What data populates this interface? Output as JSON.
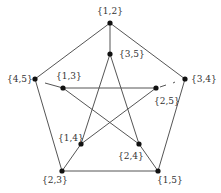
{
  "diagram": {
    "type": "graph",
    "nodes": [
      {
        "id": "12",
        "label": "{1,2}",
        "x": 110,
        "y": 23,
        "lx": 110,
        "ly": 14,
        "anchor": "middle"
      },
      {
        "id": "35",
        "label": "{3,5}",
        "x": 110,
        "y": 54,
        "lx": 119,
        "ly": 57,
        "anchor": "start"
      },
      {
        "id": "45",
        "label": "{4,5}",
        "x": 35,
        "y": 79,
        "lx": 7,
        "ly": 82,
        "anchor": "start"
      },
      {
        "id": "13",
        "label": "{1,3}",
        "x": 63,
        "y": 88,
        "lx": 56,
        "ly": 79,
        "anchor": "start"
      },
      {
        "id": "34",
        "label": "{3,4}",
        "x": 185,
        "y": 79,
        "lx": 191,
        "ly": 82,
        "anchor": "start"
      },
      {
        "id": "25",
        "label": "{2,5}",
        "x": 156,
        "y": 88,
        "lx": 154,
        "ly": 104,
        "anchor": "start"
      },
      {
        "id": "14",
        "label": "{1,4}",
        "x": 81,
        "y": 144,
        "lx": 58,
        "ly": 141,
        "anchor": "start"
      },
      {
        "id": "24",
        "label": "{2,4}",
        "x": 139,
        "y": 144,
        "lx": 118,
        "ly": 159,
        "anchor": "start"
      },
      {
        "id": "23",
        "label": "{2,3}",
        "x": 62,
        "y": 171,
        "lx": 42,
        "ly": 183,
        "anchor": "start"
      },
      {
        "id": "15",
        "label": "{1,5}",
        "x": 158,
        "y": 171,
        "lx": 157,
        "ly": 183,
        "anchor": "start"
      }
    ],
    "edges": [
      {
        "from": "12",
        "to": "45"
      },
      {
        "from": "12",
        "to": "34"
      },
      {
        "from": "45",
        "to": "23"
      },
      {
        "from": "34",
        "to": "15"
      },
      {
        "from": "23",
        "to": "15"
      },
      {
        "from": "12",
        "to": "35"
      },
      {
        "from": "23",
        "to": "14"
      },
      {
        "from": "15",
        "to": "24"
      },
      {
        "from": "35",
        "to": "14"
      },
      {
        "from": "35",
        "to": "24"
      },
      {
        "from": "13",
        "to": "25"
      },
      {
        "from": "13",
        "to": "24"
      },
      {
        "from": "25",
        "to": "14"
      }
    ],
    "partial_edges": [
      {
        "from": "45",
        "to": "13",
        "x1": 45,
        "y1": 83,
        "x2": 63,
        "y2": 88
      },
      {
        "from": "34",
        "to": "25",
        "x1": 173,
        "y1": 83,
        "x2": 175,
        "y2": 82
      },
      {
        "from": "25",
        "to": "34",
        "x1": 160,
        "y1": 87,
        "x2": 166,
        "y2": 85
      }
    ]
  }
}
